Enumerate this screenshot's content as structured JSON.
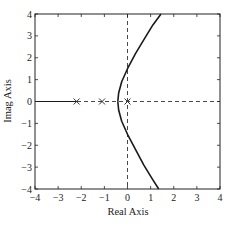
{
  "chart_data": {
    "type": "line",
    "title": "",
    "xlabel": "Real Axis",
    "ylabel": "Imag Axis",
    "xlim": [
      -4,
      4
    ],
    "ylim": [
      -4,
      4
    ],
    "xticks": [
      -4,
      -3,
      -2,
      -1,
      0,
      1,
      2,
      3,
      4
    ],
    "yticks": [
      -4,
      -3,
      -2,
      -1,
      0,
      1,
      2,
      3,
      4
    ],
    "xtick_labels": [
      "-4",
      "-3",
      "-2",
      "-1",
      "0",
      "1",
      "2",
      "3",
      "4"
    ],
    "ytick_labels": [
      "-4",
      "-3",
      "-2",
      "-1",
      "0",
      "1",
      "2",
      "3",
      "4"
    ],
    "grid": false,
    "legend": null,
    "poles": [
      {
        "re": -2.2,
        "im": 0
      },
      {
        "re": -1.1,
        "im": 0
      },
      {
        "re": 0,
        "im": 0
      }
    ],
    "reference_lines": [
      {
        "type": "dashed",
        "orientation": "vertical",
        "x": 0
      },
      {
        "type": "dashed",
        "orientation": "horizontal",
        "y": 0
      }
    ],
    "series": [
      {
        "name": "real-axis locus",
        "style": "solid",
        "x": [
          -4,
          -2.2
        ],
        "y": [
          0,
          0
        ]
      },
      {
        "name": "upper branch",
        "style": "solid",
        "x": [
          -0.42,
          -0.38,
          -0.25,
          0,
          0.35,
          0.75,
          1.1,
          1.45
        ],
        "y": [
          0,
          0.4,
          0.9,
          1.5,
          2.2,
          2.9,
          3.5,
          4.0
        ]
      },
      {
        "name": "lower branch",
        "style": "solid",
        "x": [
          -0.42,
          -0.38,
          -0.25,
          0,
          0.35,
          0.7,
          1.05,
          1.35
        ],
        "y": [
          0,
          -0.4,
          -0.9,
          -1.5,
          -2.2,
          -2.9,
          -3.5,
          -4.0
        ]
      }
    ]
  }
}
